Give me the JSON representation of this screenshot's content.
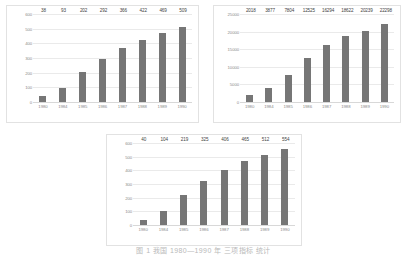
{
  "caption": "图 1 我国 1980—1990 年 三项指标 统计",
  "style": {
    "bar_color": "#767676",
    "grid_color": "#eaeaea",
    "axis_text_color": "#8a8a8a",
    "label_text_color": "#444444",
    "panel_border_color": "#e2e2e2",
    "background": "#ffffff"
  },
  "chart_data": [
    {
      "id": "chart-a",
      "type": "bar",
      "title": "",
      "xlabel": "",
      "ylabel": "",
      "categories": [
        "1980",
        "1984",
        "1985",
        "1986",
        "1987",
        "1988",
        "1989",
        "1990"
      ],
      "values": [
        38,
        93,
        202,
        292,
        366,
        422,
        469,
        509
      ],
      "yticks": [
        "600",
        "500",
        "400",
        "300",
        "200",
        "100",
        "0"
      ],
      "ylim": [
        0,
        600
      ],
      "grid": true,
      "legend": "none",
      "data_labels": true
    },
    {
      "id": "chart-b",
      "type": "bar",
      "title": "",
      "xlabel": "",
      "ylabel": "",
      "categories": [
        "1980",
        "1984",
        "1985",
        "1986",
        "1987",
        "1988",
        "1989",
        "1990"
      ],
      "values": [
        2018,
        3877,
        7804,
        12525,
        16294,
        18622,
        20239,
        22298
      ],
      "yticks": [
        "25000",
        "20000",
        "15000",
        "10000",
        "5000",
        "0"
      ],
      "ylim": [
        0,
        25000
      ],
      "grid": true,
      "legend": "none",
      "data_labels": true
    },
    {
      "id": "chart-c",
      "type": "bar",
      "title": "",
      "xlabel": "",
      "ylabel": "",
      "categories": [
        "1980",
        "1984",
        "1985",
        "1986",
        "1987",
        "1988",
        "1989",
        "1990"
      ],
      "values": [
        40,
        104,
        219,
        325,
        406,
        465,
        512,
        554
      ],
      "yticks": [
        "600",
        "500",
        "400",
        "300",
        "200",
        "100",
        "0"
      ],
      "ylim": [
        0,
        600
      ],
      "grid": true,
      "legend": "none",
      "data_labels": true
    }
  ]
}
